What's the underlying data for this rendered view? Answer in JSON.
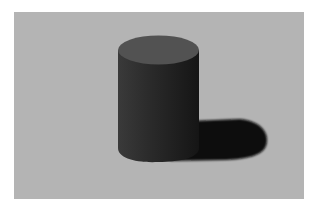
{
  "scene": {
    "description": "Rendered 3D dark cylinder standing on a light gray plane, casting a shadow to the right",
    "colors": {
      "background": "#ffffff",
      "plane": "#b4b4b4",
      "cylinder_top": "#525252",
      "cylinder_side_light": "#3e3e3e",
      "cylinder_side_dark": "#1e1e1e",
      "shadow": "#0c0c0c"
    }
  }
}
